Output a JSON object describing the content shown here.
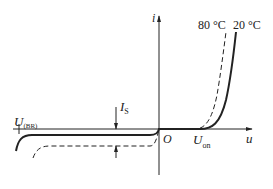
{
  "diagram": {
    "type": "diode-iv-characteristic",
    "axes": {
      "x_label": "u",
      "y_label": "i",
      "origin_label": "O"
    },
    "annotations": {
      "breakdown_voltage": {
        "main": "U",
        "sub": "(BR)"
      },
      "turn_on_voltage": {
        "main": "U",
        "sub": "on"
      },
      "saturation_current": {
        "main": "I",
        "sub": "S"
      }
    },
    "curves": [
      {
        "label": "80 °C",
        "style": "dashed"
      },
      {
        "label": "20 °C",
        "style": "solid"
      }
    ],
    "colors": {
      "line": "#222222",
      "background": "#ffffff"
    }
  }
}
